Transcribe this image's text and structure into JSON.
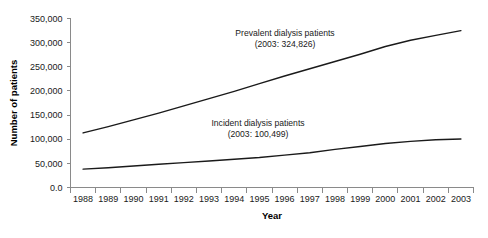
{
  "chart_data": {
    "type": "line",
    "title": "",
    "xlabel": "Year",
    "ylabel": "Number of patients",
    "categories": [
      1988,
      1989,
      1990,
      1991,
      1992,
      1993,
      1994,
      1995,
      1996,
      1997,
      1998,
      1999,
      2000,
      2001,
      2002,
      2003
    ],
    "x_tick_labels": [
      "1988",
      "1989",
      "1990",
      "1991",
      "1992",
      "1993",
      "1994",
      "1995",
      "1996",
      "1997",
      "1998",
      "1999",
      "2000",
      "2001",
      "2002",
      "2003"
    ],
    "y_tick_labels": [
      "0.0",
      "50,000",
      "100,000",
      "150,000",
      "200,000",
      "250,000",
      "300,000",
      "350,000"
    ],
    "y_tick_values": [
      0,
      50000,
      100000,
      150000,
      200000,
      250000,
      300000,
      350000
    ],
    "ylim": [
      0,
      350000
    ],
    "xlim": [
      1988,
      2003
    ],
    "grid": false,
    "legend": "none",
    "series": [
      {
        "name": "Prevalent dialysis patients",
        "color": "#1a1a1a",
        "values": [
          113000,
          126000,
          140000,
          154000,
          169000,
          184000,
          199000,
          215000,
          231000,
          246000,
          261000,
          276000,
          292000,
          305000,
          315000,
          324826
        ]
      },
      {
        "name": "Incident dialysis patients",
        "color": "#1a1a1a",
        "values": [
          38000,
          41000,
          44500,
          48000,
          51500,
          55000,
          58500,
          62000,
          67000,
          72000,
          79000,
          85000,
          91000,
          95500,
          99000,
          100499
        ]
      }
    ],
    "annotations": [
      {
        "id": "prevalent-annotation",
        "line1": "Prevalent dialysis patients",
        "line2": "(2003: 324,826)",
        "x": 285,
        "y": 36
      },
      {
        "id": "incident-annotation",
        "line1": "Incident dialysis patients",
        "line2": "(2003: 100,499)",
        "x": 258,
        "y": 126
      }
    ]
  }
}
